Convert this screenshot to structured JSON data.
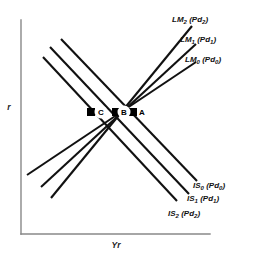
{
  "figure": {
    "background_color": "#ffffff",
    "curve_color": "#111111",
    "axis_color": "#888888",
    "marker_color": "#000000"
  },
  "axes": {
    "y_axis_label": "r",
    "x_axis_label": "Yr"
  },
  "curves": [
    {
      "id": "lm2",
      "name": "LM2",
      "base": "LM",
      "subscript": "2",
      "paren_base": "Pd",
      "paren_subscript": "2",
      "label": "LM2(Pd2)",
      "family": "LM",
      "slope": "upward",
      "x1": 51,
      "y1": 198,
      "x2": 192,
      "y2": 26
    },
    {
      "id": "lm1",
      "name": "LM1",
      "base": "LM",
      "subscript": "1",
      "paren_base": "Pd",
      "paren_subscript": "1",
      "label": "LM1(Pd1)",
      "family": "LM",
      "slope": "upward",
      "x1": 41,
      "y1": 187,
      "x2": 196,
      "y2": 44
    },
    {
      "id": "lm0",
      "name": "LM0",
      "base": "LM",
      "subscript": "0",
      "paren_base": "Pd",
      "paren_subscript": "0",
      "label": "LM0(Pd0)",
      "family": "LM",
      "slope": "upward",
      "x1": 27,
      "y1": 175,
      "x2": 196,
      "y2": 62
    },
    {
      "id": "is0",
      "name": "IS0",
      "base": "IS",
      "subscript": "0",
      "paren_base": "Pd",
      "paren_subscript": "0",
      "label": "IS0(Pd0)",
      "family": "IS",
      "slope": "downward",
      "x1": 61,
      "y1": 39,
      "x2": 197,
      "y2": 181
    },
    {
      "id": "is1",
      "name": "IS1",
      "base": "IS",
      "subscript": "1",
      "paren_base": "Pd",
      "paren_subscript": "1",
      "label": "IS1(Pd1)",
      "family": "IS",
      "slope": "downward",
      "x1": 50,
      "y1": 47,
      "x2": 189,
      "y2": 194
    },
    {
      "id": "is2",
      "name": "IS2",
      "base": "IS",
      "subscript": "2",
      "paren_base": "Pd",
      "paren_subscript": "2",
      "label": "IS2(Pd2)",
      "family": "IS",
      "slope": "downward",
      "x1": 43,
      "y1": 57,
      "x2": 177,
      "y2": 201
    }
  ],
  "curve_labels": [
    {
      "id": "label-lm2",
      "base": "LM",
      "sub": "2",
      "arg_base": "Pd",
      "arg_sub": "2",
      "x": 172,
      "y": 22
    },
    {
      "id": "label-lm1",
      "base": "LM",
      "sub": "1",
      "arg_base": "Pd",
      "arg_sub": "1",
      "x": 180,
      "y": 42
    },
    {
      "id": "label-lm0",
      "base": "LM",
      "sub": "0",
      "arg_base": "Pd",
      "arg_sub": "0",
      "x": 185,
      "y": 62
    },
    {
      "id": "label-is0",
      "base": "IS",
      "sub": "0",
      "arg_base": "Pd",
      "arg_sub": "0",
      "x": 193,
      "y": 188
    },
    {
      "id": "label-is1",
      "base": "IS",
      "sub": "1",
      "arg_base": "Pd",
      "arg_sub": "1",
      "x": 187,
      "y": 201
    },
    {
      "id": "label-is2",
      "base": "IS",
      "sub": "2",
      "arg_base": "Pd",
      "arg_sub": "2",
      "x": 168,
      "y": 216
    }
  ],
  "equilibrium_points": [
    {
      "id": "point-c",
      "label": "C",
      "x": 91,
      "y": 112,
      "label_x": 102,
      "label_y": 115
    },
    {
      "id": "point-b",
      "label": "B",
      "x": 116,
      "y": 112,
      "label_x": 124,
      "label_y": 115
    },
    {
      "id": "point-a",
      "label": "A",
      "x": 133,
      "y": 112,
      "label_x": 142,
      "label_y": 115
    }
  ]
}
